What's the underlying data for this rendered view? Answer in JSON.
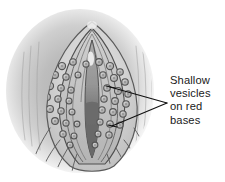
{
  "figure": {
    "title": "Shallow vesicles on red bases",
    "type": "medical-illustration",
    "rendering": "grayscale halftone drawing"
  },
  "callout": {
    "name": "vesicle-callout",
    "lines": [
      "Shallow",
      "vesicles",
      "on red",
      "bases"
    ],
    "full_text": "Shallow vesicles on red bases",
    "leader_count": 2
  },
  "colors": {
    "page_background": "#ffffff",
    "vignette_outer": "#f2f2f2",
    "vignette_mid": "#c9c9c9",
    "vignette_inner": "#a9a9a9",
    "skin_light": "#dcdcdc",
    "skin_mid": "#c4c4c4",
    "labia_fill": "#d2d2d2",
    "inner_fill": "#bdbdbd",
    "cleft_light": "#9a9a9a",
    "cleft_dark": "#6b6b6b",
    "highlight": "#f4f4f4",
    "outline": "#4a4a4a",
    "vesicle_ring": "#5f5f5f",
    "vesicle_fill": "#b8b8b8",
    "vesicle_core": "#8f8f8f",
    "text": "#1a1a1a",
    "leader_line": "#111111"
  },
  "geometry": {
    "width": 225,
    "height": 182,
    "vignette_center": [
      80,
      91
    ],
    "apex": [
      92,
      22
    ],
    "leader_converge": [
      167,
      103
    ],
    "leader_anchor_upper": [
      110,
      87
    ],
    "leader_anchor_lower": [
      112,
      126
    ]
  },
  "vesicles": {
    "description": "small round vesicles with dark rings and pale centers scattered over the labial surfaces",
    "count": 38,
    "points": [
      [
        62,
        66
      ],
      [
        73,
        62
      ],
      [
        86,
        64
      ],
      [
        99,
        62
      ],
      [
        110,
        66
      ],
      [
        120,
        72
      ],
      [
        55,
        75
      ],
      [
        66,
        77
      ],
      [
        78,
        75
      ],
      [
        103,
        75
      ],
      [
        114,
        78
      ],
      [
        125,
        82
      ],
      [
        50,
        86
      ],
      [
        61,
        88
      ],
      [
        71,
        90
      ],
      [
        107,
        88
      ],
      [
        118,
        91
      ],
      [
        128,
        94
      ],
      [
        47,
        97
      ],
      [
        58,
        99
      ],
      [
        69,
        101
      ],
      [
        104,
        99
      ],
      [
        115,
        101
      ],
      [
        126,
        104
      ],
      [
        50,
        109
      ],
      [
        61,
        111
      ],
      [
        72,
        112
      ],
      [
        102,
        110
      ],
      [
        113,
        112
      ],
      [
        123,
        114
      ],
      [
        55,
        121
      ],
      [
        66,
        123
      ],
      [
        77,
        124
      ],
      [
        100,
        122
      ],
      [
        110,
        124
      ],
      [
        120,
        125
      ],
      [
        63,
        134
      ],
      [
        74,
        136
      ],
      [
        98,
        134
      ],
      [
        109,
        135
      ],
      [
        70,
        145
      ],
      [
        95,
        145
      ]
    ]
  }
}
